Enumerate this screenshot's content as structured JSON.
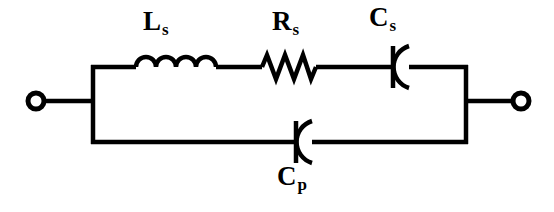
{
  "figure": {
    "kind": "electrical-circuit-schematic",
    "background_color": "#ffffff",
    "line_color": "#000000",
    "line_width_px": 4
  },
  "labels": {
    "inductor": {
      "base": "L",
      "sub": "s",
      "full": "Ls"
    },
    "resistor": {
      "base": "R",
      "sub": "s",
      "full": "Rs"
    },
    "series_capacitor": {
      "base": "C",
      "sub": "s",
      "full": "Cs"
    },
    "parallel_capacitor": {
      "base": "C",
      "sub": "p",
      "full": "Cp"
    }
  },
  "components": [
    {
      "name": "inductor-Ls",
      "type": "inductor",
      "branch": "series",
      "coils": 4,
      "label": "Ls"
    },
    {
      "name": "resistor-Rs",
      "type": "resistor",
      "branch": "series",
      "peaks": 3,
      "label": "Rs"
    },
    {
      "name": "capacitor-Cs",
      "type": "capacitor-polarized",
      "branch": "series",
      "label": "Cs"
    },
    {
      "name": "capacitor-Cp",
      "type": "capacitor-polarized",
      "branch": "parallel",
      "label": "Cp"
    }
  ],
  "terminals": [
    {
      "name": "terminal-left",
      "side": "left",
      "style": "open-circle"
    },
    {
      "name": "terminal-right",
      "side": "right",
      "style": "open-circle"
    }
  ],
  "geometry": {
    "canvas": {
      "width": 554,
      "height": 212
    },
    "top_rail_y": 67,
    "bottom_rail_y": 142,
    "mid_y": 101,
    "left_rail_x": 93,
    "right_rail_x": 466,
    "terminal_left_cx": 36,
    "terminal_right_cx": 521,
    "terminal_radius": 8
  }
}
